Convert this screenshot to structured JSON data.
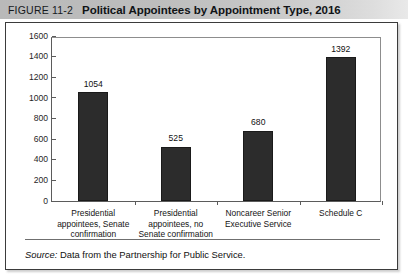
{
  "header": {
    "figure_number": "FIGURE 11-2",
    "title": "Political Appointees by Appointment Type, 2016",
    "band_color_left": "#b9b9b9",
    "band_color_right": "#e9e9e9"
  },
  "source": {
    "label": "Source:",
    "text": "Data from the Partnership for Public Service."
  },
  "chart_data": {
    "type": "bar",
    "title": "Political Appointees by Appointment Type, 2016",
    "xlabel": "",
    "ylabel": "",
    "ylim": [
      0,
      1600
    ],
    "ytick_step": 200,
    "yticks": [
      0,
      200,
      400,
      600,
      800,
      1000,
      1200,
      1400,
      1600
    ],
    "ytick_labels": [
      "0",
      "200",
      "400",
      "600",
      "800",
      "1000",
      "1200",
      "1400",
      "1600"
    ],
    "grid": false,
    "legend": false,
    "bar_color": "#2c2c2c",
    "categories": [
      "Presidential appointees, Senate confirmation",
      "Presidential appointees, no Senate confirmation",
      "Noncareer Senior Executive Service",
      "Schedule C"
    ],
    "category_lines": [
      [
        "Presidential",
        "appointees, Senate",
        "confirmation"
      ],
      [
        "Presidential",
        "appointees, no",
        "Senate confirmation"
      ],
      [
        "Noncareer Senior",
        "Executive Service"
      ],
      [
        "Schedule C"
      ]
    ],
    "values": [
      1054,
      525,
      680,
      1392
    ],
    "value_labels": [
      "1054",
      "525",
      "680",
      "1392"
    ]
  }
}
